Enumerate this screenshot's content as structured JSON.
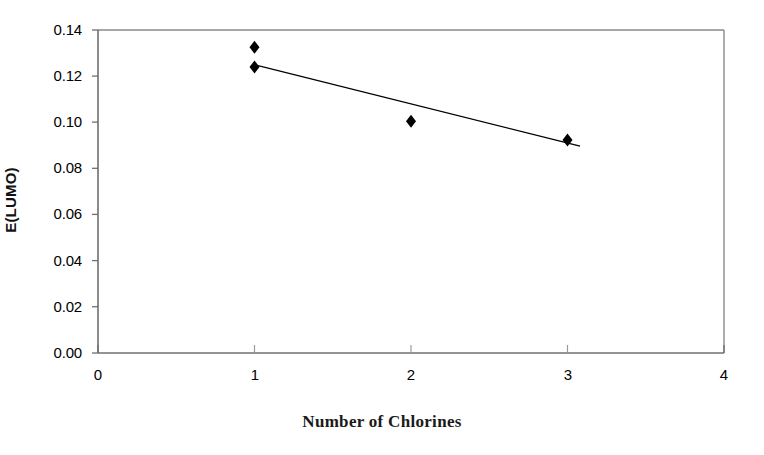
{
  "chart_data": {
    "type": "scatter",
    "title": "",
    "xlabel": "Number of Chlorines",
    "ylabel": "E(LUMO)",
    "xlim": [
      0,
      4
    ],
    "ylim": [
      0.0,
      0.14
    ],
    "grid": false,
    "legend": null,
    "xticks": [
      "0",
      "1",
      "2",
      "3",
      "4"
    ],
    "xtick_values": [
      0,
      1,
      2,
      3,
      4
    ],
    "yticks": [
      "0.00",
      "0.02",
      "0.04",
      "0.06",
      "0.08",
      "0.10",
      "0.12",
      "0.14"
    ],
    "ytick_values": [
      0.0,
      0.02,
      0.04,
      0.06,
      0.08,
      0.1,
      0.12,
      0.14
    ],
    "marker": "diamond",
    "marker_color": "#000000",
    "points": [
      {
        "x": 1,
        "y": 0.1325
      },
      {
        "x": 1,
        "y": 0.124
      },
      {
        "x": 2,
        "y": 0.1005
      },
      {
        "x": 3,
        "y": 0.0923
      }
    ],
    "series": [
      {
        "name": "E(LUMO) data",
        "x": [
          1,
          1,
          2,
          3
        ],
        "values": [
          0.1325,
          0.124,
          0.1005,
          0.0923
        ]
      },
      {
        "name": "linear trend line",
        "type": "line",
        "color": "#000000",
        "x": [
          1.01,
          3.08
        ],
        "values": [
          0.1248,
          0.0897
        ]
      }
    ]
  },
  "axes": {
    "y_label": "E(LUMO)",
    "x_label": "Number of Chlorines",
    "y_tick_labels": [
      "0.14",
      "0.12",
      "0.10",
      "0.08",
      "0.06",
      "0.04",
      "0.02",
      "0.00"
    ],
    "x_tick_labels": [
      "0",
      "1",
      "2",
      "3",
      "4"
    ]
  },
  "colors": {
    "background": "#ffffff",
    "axis": "#6b6b6b",
    "marker": "#000000",
    "trendline": "#2b2b2b",
    "text": "#000000"
  }
}
